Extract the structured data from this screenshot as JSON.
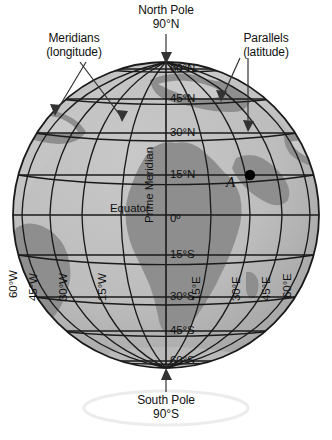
{
  "figure": {
    "background_color": "#ffffff",
    "ocean_color": "#b9b9b9",
    "land_color": "#8e8e8e",
    "land_highlight_color": "#c9c9c9",
    "grid_color": "#1a1a1a",
    "outline_color": "#1a1a1a",
    "text_color": "#111111",
    "point_color": "#000000",
    "orbit_ring_color": "#ededed"
  },
  "callouts": {
    "meridians": {
      "line1": "Meridians",
      "line2": "(longitude)"
    },
    "parallels": {
      "line1": "Parallels",
      "line2": "(latitude)"
    }
  },
  "poles": {
    "north": {
      "name": "North Pole",
      "value": "90°N"
    },
    "south": {
      "name": "South Pole",
      "value": "90°S"
    }
  },
  "reference_lines": {
    "prime_meridian": "Prime Meridian",
    "equator": "Equator",
    "equator_value": "0º"
  },
  "latitudes": [
    {
      "label": "60°N",
      "value": 60,
      "hemisphere": "N"
    },
    {
      "label": "45°N",
      "value": 45,
      "hemisphere": "N"
    },
    {
      "label": "30°N",
      "value": 30,
      "hemisphere": "N"
    },
    {
      "label": "15°N",
      "value": 15,
      "hemisphere": "N"
    },
    {
      "label": "0º",
      "value": 0,
      "hemisphere": "E"
    },
    {
      "label": "15°S",
      "value": -15,
      "hemisphere": "S"
    },
    {
      "label": "30°S",
      "value": -30,
      "hemisphere": "S"
    },
    {
      "label": "45°S",
      "value": -45,
      "hemisphere": "S"
    },
    {
      "label": "60°S",
      "value": -60,
      "hemisphere": "S"
    }
  ],
  "longitudes": [
    {
      "label": "60°W",
      "value": -60,
      "hemisphere": "W"
    },
    {
      "label": "45°W",
      "value": -45,
      "hemisphere": "W"
    },
    {
      "label": "30°W",
      "value": -30,
      "hemisphere": "W"
    },
    {
      "label": "15°W",
      "value": -15,
      "hemisphere": "W"
    },
    {
      "label": "15°E",
      "value": 15,
      "hemisphere": "E"
    },
    {
      "label": "30°E",
      "value": 30,
      "hemisphere": "E"
    },
    {
      "label": "45°E",
      "value": 45,
      "hemisphere": "E"
    },
    {
      "label": "60°E",
      "value": 60,
      "hemisphere": "E"
    }
  ],
  "marked_point": {
    "label": "A",
    "latitude": "15°N",
    "longitude": "30°E"
  }
}
